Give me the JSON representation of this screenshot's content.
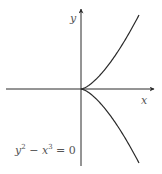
{
  "diagram": {
    "equation": {
      "term1_base": "y",
      "term1_exp": "2",
      "operator": " − ",
      "term2_base": "x",
      "term2_exp": "3",
      "rhs": " = 0",
      "full": "y² − x³ = 0"
    },
    "axes": {
      "x_label": "x",
      "y_label": "y"
    },
    "curve": {
      "type": "semicubical parabola (cusp at origin)",
      "branches": [
        "y = x^(3/2)",
        "y = -x^(3/2)"
      ]
    },
    "colors": {
      "axis": "#2a2a2a",
      "curve": "#2a2a2a",
      "label": "#555555",
      "background": "#ffffff"
    }
  }
}
